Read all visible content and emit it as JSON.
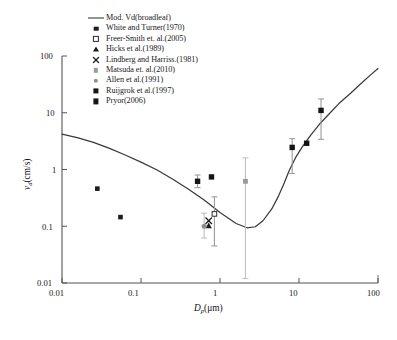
{
  "chart_data": {
    "type": "scatter",
    "title": "",
    "xlabel": "Dp(μm)",
    "ylabel": "vd(cm/s)",
    "xscale": "log",
    "yscale": "log",
    "xlim": [
      0.01,
      100
    ],
    "ylim": [
      0.01,
      100
    ],
    "xticks": [
      "0.01",
      "0.1",
      "1",
      "10",
      "100"
    ],
    "yticks": [
      "0.01",
      "0.1",
      "1",
      "10",
      "100"
    ],
    "grid": false,
    "legend_position": "top-left",
    "legend": [
      {
        "label": "Mod. Vd(broadleaf)",
        "marker": "line",
        "color": "#2b2b2b"
      },
      {
        "label": "White and Turner(1970)",
        "marker": "square-filled",
        "color": "#1c1c1c"
      },
      {
        "label": "Freer-Smith et. al.(2005)",
        "marker": "square-open",
        "color": "#2b2b2b"
      },
      {
        "label": "Hicks et al.(1989)",
        "marker": "triangle-filled",
        "color": "#1c1c1c"
      },
      {
        "label": "Lindberg and Harriss.(1981)",
        "marker": "x-cross",
        "color": "#1c1c1c"
      },
      {
        "label": "Matsuda et. al.(2010)",
        "marker": "square-gray",
        "color": "#9a9a9a"
      },
      {
        "label": "Allen et al.(1991)",
        "marker": "circle-gray",
        "color": "#8e8e8e"
      },
      {
        "label": "Ruijgrok et al.(1997)",
        "marker": "square-filled-large",
        "color": "#151515"
      },
      {
        "label": "Pryor(2006)",
        "marker": "square-filled-large",
        "color": "#151515"
      }
    ],
    "series": [
      {
        "name": "Mod. Vd(broadleaf)",
        "marker": "line",
        "type": "line",
        "points": [
          {
            "x": 0.01,
            "y": 4.2
          },
          {
            "x": 0.016,
            "y": 3.6
          },
          {
            "x": 0.025,
            "y": 3.0
          },
          {
            "x": 0.04,
            "y": 2.35
          },
          {
            "x": 0.063,
            "y": 1.8
          },
          {
            "x": 0.1,
            "y": 1.35
          },
          {
            "x": 0.16,
            "y": 0.98
          },
          {
            "x": 0.25,
            "y": 0.68
          },
          {
            "x": 0.4,
            "y": 0.45
          },
          {
            "x": 0.63,
            "y": 0.29
          },
          {
            "x": 1.0,
            "y": 0.175
          },
          {
            "x": 1.6,
            "y": 0.112
          },
          {
            "x": 2.2,
            "y": 0.094
          },
          {
            "x": 2.8,
            "y": 0.098
          },
          {
            "x": 3.5,
            "y": 0.125
          },
          {
            "x": 4.5,
            "y": 0.2
          },
          {
            "x": 5.5,
            "y": 0.34
          },
          {
            "x": 6.5,
            "y": 0.58
          },
          {
            "x": 7.5,
            "y": 0.95
          },
          {
            "x": 9.0,
            "y": 1.6
          },
          {
            "x": 11.0,
            "y": 2.5
          },
          {
            "x": 14.0,
            "y": 4.0
          },
          {
            "x": 18.0,
            "y": 6.2
          },
          {
            "x": 24.0,
            "y": 9.5
          },
          {
            "x": 32.0,
            "y": 14.5
          },
          {
            "x": 45.0,
            "y": 22.0
          },
          {
            "x": 60.0,
            "y": 32.0
          },
          {
            "x": 80.0,
            "y": 46.0
          },
          {
            "x": 100.0,
            "y": 60.0
          }
        ]
      },
      {
        "name": "White and Turner(1970)",
        "marker": "square-filled",
        "type": "scatter",
        "points": [
          {
            "x": 0.028,
            "y": 0.46,
            "yerr_low": null,
            "yerr_high": null
          },
          {
            "x": 0.055,
            "y": 0.145,
            "yerr_low": null,
            "yerr_high": null
          }
        ]
      },
      {
        "name": "Freer-Smith et. al.(2005)",
        "marker": "square-open",
        "type": "scatter",
        "points": [
          {
            "x": 0.85,
            "y": 0.165,
            "yerr_low": 0.045,
            "yerr_high": 0.33
          }
        ]
      },
      {
        "name": "Hicks et al.(1989)",
        "marker": "triangle-filled",
        "type": "scatter",
        "points": [
          {
            "x": 0.72,
            "y": 0.102,
            "yerr_low": null,
            "yerr_high": null
          }
        ]
      },
      {
        "name": "Lindberg and Harriss.(1981)",
        "marker": "x-cross",
        "type": "scatter",
        "points": [
          {
            "x": 0.72,
            "y": 0.125,
            "yerr_low": null,
            "yerr_high": null
          }
        ]
      },
      {
        "name": "Matsuda et. al.(2010)",
        "marker": "square-gray",
        "type": "scatter",
        "points": [
          {
            "x": 2.1,
            "y": 0.62,
            "yerr_low": 0.012,
            "yerr_high": 1.6
          }
        ]
      },
      {
        "name": "Allen et al.(1991)",
        "marker": "circle-gray",
        "type": "scatter",
        "points": [
          {
            "x": 0.63,
            "y": 0.1,
            "yerr_low": 0.062,
            "yerr_high": 0.17
          }
        ]
      },
      {
        "name": "Ruijgrok et al.(1997)",
        "marker": "square-filled-large",
        "type": "scatter",
        "points": [
          {
            "x": 0.52,
            "y": 0.62,
            "yerr_low": 0.48,
            "yerr_high": 0.8
          },
          {
            "x": 0.78,
            "y": 0.74,
            "yerr_low": null,
            "yerr_high": null
          }
        ]
      },
      {
        "name": "Pryor(2006)",
        "marker": "square-filled-large",
        "type": "scatter",
        "points": [
          {
            "x": 8.2,
            "y": 2.45,
            "yerr_low": 0.85,
            "yerr_high": 3.5
          },
          {
            "x": 12.5,
            "y": 2.9,
            "yerr_low": null,
            "yerr_high": null
          },
          {
            "x": 19.0,
            "y": 11.0,
            "yerr_low": 3.4,
            "yerr_high": 17.5
          }
        ]
      }
    ]
  },
  "axes": {
    "x_label_main": "D",
    "x_label_sub": "p",
    "x_label_unit": "(μm)",
    "y_label_main": "v",
    "y_label_sub": "d",
    "y_label_unit": "(cm/s)"
  }
}
